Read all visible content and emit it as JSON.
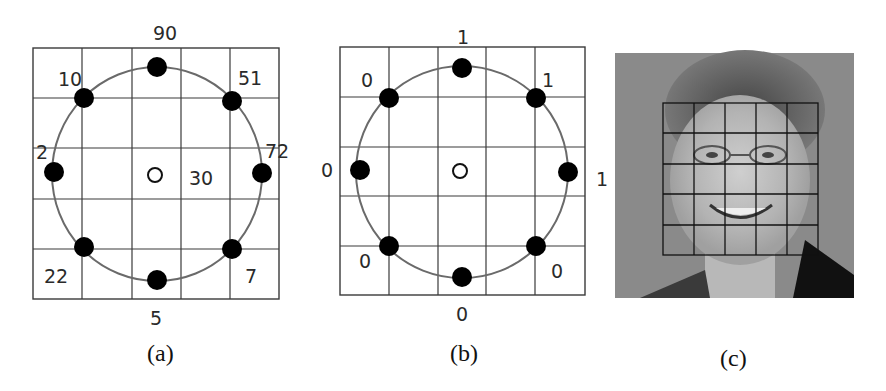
{
  "figure": {
    "panels": [
      {
        "id": "a",
        "caption": "(a)",
        "description": "3x3 LBP neighborhood on 5x5 grid with grayscale values",
        "center_value": "30",
        "neighbors": {
          "top": "90",
          "top_right": "51",
          "right": "72",
          "bottom_right": "7",
          "bottom": "5",
          "bottom_left": "22",
          "left": "2",
          "top_left": "10"
        }
      },
      {
        "id": "b",
        "caption": "(b)",
        "description": "Thresholded binary pattern",
        "neighbors": {
          "top": "1",
          "top_right": "1",
          "right": "1",
          "bottom_right": "0",
          "bottom": "0",
          "bottom_left": "0",
          "left": "0",
          "top_left": "0"
        }
      },
      {
        "id": "c",
        "caption": "(c)",
        "description": "Face image divided into 5x5 grid of regions",
        "grid_rows": 5,
        "grid_cols": 5
      }
    ]
  },
  "colors": {
    "grid_line": "#3a3a3a",
    "circle": "#6a6a6a",
    "dot": "#000000",
    "photo_bg": "#8a8a8a"
  }
}
